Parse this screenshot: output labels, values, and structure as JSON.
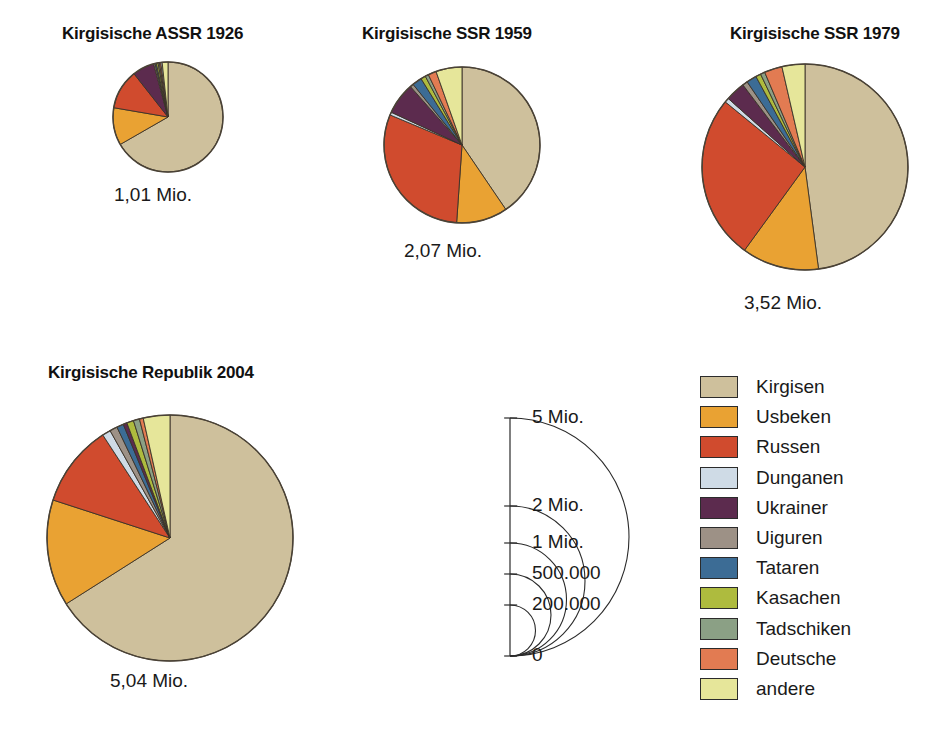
{
  "figure": {
    "kind": "proportional-pie-series"
  },
  "legend": {
    "position": "bottom-right",
    "entries": [
      {
        "label": "Kirgisen",
        "color": "#cec09c"
      },
      {
        "label": "Usbeken",
        "color": "#e9a233"
      },
      {
        "label": "Russen",
        "color": "#d04b2e"
      },
      {
        "label": "Dunganen",
        "color": "#cfdbe6"
      },
      {
        "label": "Ukrainer",
        "color": "#5c2b4e"
      },
      {
        "label": "Uiguren",
        "color": "#9d9186"
      },
      {
        "label": "Tataren",
        "color": "#3c6c95"
      },
      {
        "label": "Kasachen",
        "color": "#aebb3e"
      },
      {
        "label": "Tadschiken",
        "color": "#8ba085"
      },
      {
        "label": "Deutsche",
        "color": "#e27b52"
      },
      {
        "label": "andere",
        "color": "#e6e69a"
      }
    ]
  },
  "scale_key": {
    "caption_ticks": [
      "5 Mio.",
      "2 Mio.",
      "1 Mio.",
      "500.000",
      "200.000",
      "0"
    ],
    "tick_values": [
      5000000,
      2000000,
      1000000,
      500000,
      200000,
      0
    ],
    "axis_label_unit": "Mio.",
    "note": "Kreisflaeche proportional zur Einwohnerzahl"
  },
  "chart_data": [
    {
      "type": "pie",
      "title": "Kirgisische ASSR 1926",
      "total_label": "1,01 Mio.",
      "total_value": 1010000,
      "categories": [
        "Kirgisen",
        "Usbeken",
        "Russen",
        "Ukrainer",
        "Uiguren",
        "Tataren",
        "Kasachen",
        "Tadschiken",
        "Deutsche",
        "Dunganen",
        "andere"
      ],
      "values": [
        66.7,
        11.0,
        11.7,
        6.4,
        0.4,
        0.4,
        0.5,
        0.4,
        0.4,
        0.4,
        1.7
      ],
      "unit": "%",
      "radius_px": 55
    },
    {
      "type": "pie",
      "title": "Kirgisische SSR 1959",
      "total_label": "2,07 Mio.",
      "total_value": 2070000,
      "categories": [
        "Kirgisen",
        "Usbeken",
        "Russen",
        "Ukrainer",
        "Uiguren",
        "Tataren",
        "Kasachen",
        "Tadschiken",
        "Deutsche",
        "Dunganen",
        "andere"
      ],
      "values": [
        40.5,
        10.6,
        30.2,
        6.6,
        0.7,
        2.0,
        1.0,
        0.7,
        1.7,
        0.6,
        5.4
      ],
      "unit": "%",
      "radius_px": 78
    },
    {
      "type": "pie",
      "title": "Kirgisische SSR 1979",
      "total_label": "3,52 Mio.",
      "total_value": 3520000,
      "categories": [
        "Kirgisen",
        "Usbeken",
        "Russen",
        "Ukrainer",
        "Uiguren",
        "Tataren",
        "Kasachen",
        "Tadschiken",
        "Deutsche",
        "Dunganen",
        "andere"
      ],
      "values": [
        47.9,
        12.1,
        25.9,
        3.1,
        0.8,
        1.6,
        0.8,
        0.7,
        2.8,
        0.7,
        3.6
      ],
      "unit": "%",
      "radius_px": 103
    },
    {
      "type": "pie",
      "title": "Kirgisische Republik 2004",
      "total_label": "5,04 Mio.",
      "total_value": 5040000,
      "categories": [
        "Kirgisen",
        "Usbeken",
        "Russen",
        "Ukrainer",
        "Uiguren",
        "Tataren",
        "Kasachen",
        "Tadschiken",
        "Deutsche",
        "Dunganen",
        "andere"
      ],
      "values": [
        66.0,
        14.0,
        10.8,
        0.5,
        1.0,
        0.9,
        0.9,
        0.8,
        0.5,
        1.1,
        3.5
      ],
      "unit": "%",
      "radius_px": 123
    }
  ],
  "pies": [
    {
      "id": "pie-1926",
      "title": "Kirgisische ASSR 1926",
      "caption": "1,01 Mio.",
      "cx": 168,
      "cy": 117,
      "r": 55,
      "title_x": 62,
      "title_y": 24,
      "caption_x": 114,
      "caption_y": 184,
      "slices": [
        {
          "name": "Kirgisen",
          "pct": 66.7,
          "color": "#cec09c"
        },
        {
          "name": "Usbeken",
          "pct": 11.0,
          "color": "#e9a233"
        },
        {
          "name": "Russen",
          "pct": 11.7,
          "color": "#d04b2e"
        },
        {
          "name": "Ukrainer",
          "pct": 6.4,
          "color": "#5c2b4e"
        },
        {
          "name": "Uiguren",
          "pct": 0.4,
          "color": "#9d9186"
        },
        {
          "name": "Tataren",
          "pct": 0.4,
          "color": "#3c6c95"
        },
        {
          "name": "Kasachen",
          "pct": 0.5,
          "color": "#aebb3e"
        },
        {
          "name": "Tadschiken",
          "pct": 0.4,
          "color": "#8ba085"
        },
        {
          "name": "Deutsche",
          "pct": 0.4,
          "color": "#e27b52"
        },
        {
          "name": "Dunganen",
          "pct": 0.4,
          "color": "#cfdbe6"
        },
        {
          "name": "andere",
          "pct": 1.7,
          "color": "#e6e69a"
        }
      ]
    },
    {
      "id": "pie-1959",
      "title": "Kirgisische SSR 1959",
      "caption": "2,07 Mio.",
      "cx": 462,
      "cy": 145,
      "r": 78,
      "title_x": 362,
      "title_y": 24,
      "caption_x": 404,
      "caption_y": 240,
      "slices": [
        {
          "name": "Kirgisen",
          "pct": 40.5,
          "color": "#cec09c"
        },
        {
          "name": "Usbeken",
          "pct": 10.6,
          "color": "#e9a233"
        },
        {
          "name": "Russen",
          "pct": 30.2,
          "color": "#d04b2e"
        },
        {
          "name": "Dunganen",
          "pct": 0.6,
          "color": "#cfdbe6"
        },
        {
          "name": "Ukrainer",
          "pct": 6.6,
          "color": "#5c2b4e"
        },
        {
          "name": "Uiguren",
          "pct": 0.7,
          "color": "#9d9186"
        },
        {
          "name": "Tataren",
          "pct": 2.0,
          "color": "#3c6c95"
        },
        {
          "name": "Kasachen",
          "pct": 1.0,
          "color": "#aebb3e"
        },
        {
          "name": "Tadschiken",
          "pct": 0.7,
          "color": "#8ba085"
        },
        {
          "name": "Deutsche",
          "pct": 1.7,
          "color": "#e27b52"
        },
        {
          "name": "andere",
          "pct": 5.4,
          "color": "#e6e69a"
        }
      ]
    },
    {
      "id": "pie-1979",
      "title": "Kirgisische SSR 1979",
      "caption": "3,52 Mio.",
      "cx": 805,
      "cy": 167,
      "r": 103,
      "title_x": 730,
      "title_y": 24,
      "caption_x": 744,
      "caption_y": 292,
      "slices": [
        {
          "name": "Kirgisen",
          "pct": 47.9,
          "color": "#cec09c"
        },
        {
          "name": "Usbeken",
          "pct": 12.1,
          "color": "#e9a233"
        },
        {
          "name": "Russen",
          "pct": 25.9,
          "color": "#d04b2e"
        },
        {
          "name": "Dunganen",
          "pct": 0.7,
          "color": "#cfdbe6"
        },
        {
          "name": "Ukrainer",
          "pct": 3.1,
          "color": "#5c2b4e"
        },
        {
          "name": "Uiguren",
          "pct": 0.8,
          "color": "#9d9186"
        },
        {
          "name": "Tataren",
          "pct": 1.6,
          "color": "#3c6c95"
        },
        {
          "name": "Kasachen",
          "pct": 0.8,
          "color": "#aebb3e"
        },
        {
          "name": "Tadschiken",
          "pct": 0.7,
          "color": "#8ba085"
        },
        {
          "name": "Deutsche",
          "pct": 2.8,
          "color": "#e27b52"
        },
        {
          "name": "andere",
          "pct": 3.6,
          "color": "#e6e69a"
        }
      ]
    },
    {
      "id": "pie-2004",
      "title": "Kirgisische Republik 2004",
      "caption": "5,04 Mio.",
      "cx": 170,
      "cy": 538,
      "r": 123,
      "title_x": 48,
      "title_y": 363,
      "caption_x": 110,
      "caption_y": 670,
      "slices": [
        {
          "name": "Kirgisen",
          "pct": 66.0,
          "color": "#cec09c"
        },
        {
          "name": "Usbeken",
          "pct": 14.0,
          "color": "#e9a233"
        },
        {
          "name": "Russen",
          "pct": 10.8,
          "color": "#d04b2e"
        },
        {
          "name": "Dunganen",
          "pct": 1.1,
          "color": "#cfdbe6"
        },
        {
          "name": "Uiguren",
          "pct": 1.0,
          "color": "#9d9186"
        },
        {
          "name": "Tataren",
          "pct": 0.9,
          "color": "#3c6c95"
        },
        {
          "name": "Ukrainer",
          "pct": 0.5,
          "color": "#5c2b4e"
        },
        {
          "name": "Kasachen",
          "pct": 0.9,
          "color": "#aebb3e"
        },
        {
          "name": "Tadschiken",
          "pct": 0.8,
          "color": "#8ba085"
        },
        {
          "name": "Deutsche",
          "pct": 0.5,
          "color": "#e27b52"
        },
        {
          "name": "andere",
          "pct": 3.5,
          "color": "#e6e69a"
        }
      ]
    }
  ],
  "scale_diagram": {
    "axis_x": 510,
    "base_y": 656,
    "ticks": [
      {
        "label": "5 Mio.",
        "y": 418,
        "r": 238
      },
      {
        "label": "2 Mio.",
        "y": 506,
        "r": 150
      },
      {
        "label": "1 Mio.",
        "y": 543,
        "r": 113
      },
      {
        "label": "500.000",
        "y": 574,
        "r": 82
      },
      {
        "label": "200.000",
        "y": 605,
        "r": 51
      },
      {
        "label": "0",
        "y": 656,
        "r": 0
      }
    ],
    "label_dx": 22,
    "tick_len": 13
  }
}
